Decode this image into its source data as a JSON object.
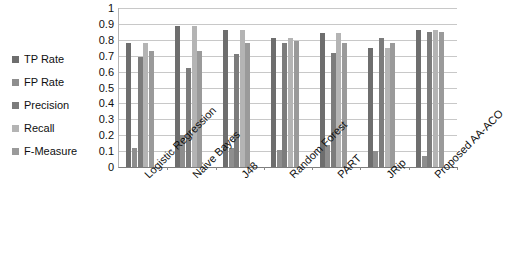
{
  "chart_data": {
    "type": "bar",
    "title": "",
    "xlabel": "",
    "ylabel": "",
    "ylim": [
      0,
      1
    ],
    "ytick_labels": [
      "1",
      "0.9",
      "0.8",
      "0.7",
      "0.6",
      "0.5",
      "0.4",
      "0.3",
      "0.2",
      "0.1",
      "0"
    ],
    "ytick_values": [
      1,
      0.9,
      0.8,
      0.7,
      0.6,
      0.5,
      0.4,
      0.3,
      0.2,
      0.1,
      0
    ],
    "grid": true,
    "legend_position": "left",
    "categories": [
      "Logistic Regression",
      "Naive Bayes",
      "J48",
      "Random Forest",
      "PART",
      "JRip",
      "Proposed AA-ACO"
    ],
    "series": [
      {
        "name": "TP Rate",
        "color": "#6e6e6e",
        "values": [
          0.78,
          0.89,
          0.86,
          0.81,
          0.84,
          0.75,
          0.86
        ]
      },
      {
        "name": "FP Rate",
        "color": "#8e8e8e",
        "values": [
          0.12,
          0.2,
          0.12,
          0.11,
          0.14,
          0.1,
          0.07
        ]
      },
      {
        "name": "Precision",
        "color": "#7c7c7c",
        "values": [
          0.69,
          0.62,
          0.71,
          0.78,
          0.72,
          0.81,
          0.85
        ]
      },
      {
        "name": "Recall",
        "color": "#b4b4b4",
        "values": [
          0.78,
          0.89,
          0.86,
          0.81,
          0.84,
          0.75,
          0.86
        ]
      },
      {
        "name": "F-Measure",
        "color": "#9a9a9a",
        "values": [
          0.73,
          0.73,
          0.78,
          0.79,
          0.78,
          0.78,
          0.85
        ]
      }
    ]
  }
}
